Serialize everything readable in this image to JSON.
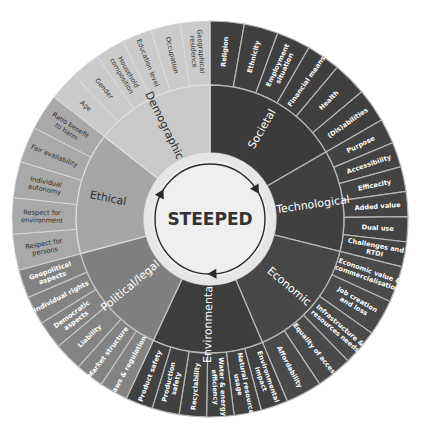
{
  "center": {
    "label": "STEEPED",
    "text_color": "#333333"
  },
  "geometry": {
    "cx": 210,
    "cy": 219,
    "outer_r": 198,
    "mid_r": 134,
    "hub_outer_r": 66,
    "hub_inner_r": 58
  },
  "colors": {
    "hub_ring": "#e6e6e6",
    "hub_fill": "#efefef",
    "arrow": "#2a2a2a",
    "divider_dark": "#b8b8b8",
    "divider_light": "#e2e2e2"
  },
  "categories": [
    {
      "label": "Societal",
      "start": 0,
      "end": 60,
      "fill": "#3b3b3b",
      "outer_fill": "#3f3f3f",
      "text": "#ffffff",
      "divider": "#b8b8b8",
      "items": [
        [
          "Religion"
        ],
        [
          "Ethnicity"
        ],
        [
          "Employment",
          "situation"
        ],
        [
          "Financial means"
        ],
        [
          "Health"
        ],
        [
          "(Dis)abilities"
        ]
      ]
    },
    {
      "label": "Technological",
      "start": 60,
      "end": 104,
      "fill": "#404040",
      "outer_fill": "#434343",
      "text": "#ffffff",
      "divider": "#b8b8b8",
      "items": [
        [
          "Purpose"
        ],
        [
          "Accessibility"
        ],
        [
          "Efficacity"
        ],
        [
          "Added value"
        ],
        [
          "Dual use"
        ],
        [
          "Challenges and",
          "RTDI"
        ]
      ]
    },
    {
      "label": "Economic",
      "start": 104,
      "end": 157,
      "fill": "#474747",
      "outer_fill": "#4a4a4a",
      "text": "#ffffff",
      "divider": "#b8b8b8",
      "items": [
        [
          "Economic value &",
          "commercialisation"
        ],
        [
          "Job creation",
          "and loss"
        ],
        [
          "Infrastructure &",
          "resources needs"
        ],
        [
          "Equality of access"
        ],
        [
          "Affordability"
        ]
      ]
    },
    {
      "label": "Environmental",
      "start": 157,
      "end": 205,
      "fill": "#3d3d3d",
      "outer_fill": "#414141",
      "text": "#ffffff",
      "divider": "#b8b8b8",
      "items": [
        [
          "Environmental",
          "impact"
        ],
        [
          "Natural resource",
          "usage"
        ],
        [
          "Water & energy",
          "efficiency"
        ],
        [
          "Recyclability"
        ],
        [
          "Production",
          "safety"
        ],
        [
          "Product safety"
        ]
      ]
    },
    {
      "label": "Political/legal",
      "start": 205,
      "end": 255,
      "fill": "#7f7f7f",
      "outer_fill": "#838383",
      "text": "#ffffff",
      "divider": "#c4c4c4",
      "items": [
        [
          "Laws & regulation"
        ],
        [
          "Market structure"
        ],
        [
          "Liability"
        ],
        [
          "Democratic",
          "aspects"
        ],
        [
          "Individual rights"
        ],
        [
          "Geopolitical",
          "aspects"
        ]
      ]
    },
    {
      "label": "Ethical",
      "start": 255,
      "end": 308,
      "fill": "#a6a6a6",
      "outer_fill": "#a9a9a9",
      "text": "#2e2e2e",
      "divider": "#dcdcdc",
      "items": [
        [
          "Respect for",
          "persons"
        ],
        [
          "Respect for",
          "environment"
        ],
        [
          "Individual",
          "autonomy"
        ],
        [
          "Fair availability"
        ],
        [
          "Ratio benefit",
          "to harm"
        ]
      ]
    },
    {
      "label": "Demographic",
      "start": 308,
      "end": 360,
      "fill": "#c9c9c9",
      "outer_fill": "#cbcbcb",
      "text": "#2e2e2e",
      "divider": "#dedede",
      "items": [
        [
          "Age"
        ],
        [
          "Gender"
        ],
        [
          "Household",
          "composition"
        ],
        [
          "Education level"
        ],
        [
          "Occupation"
        ],
        [
          "Geographical",
          "residence"
        ]
      ]
    }
  ]
}
